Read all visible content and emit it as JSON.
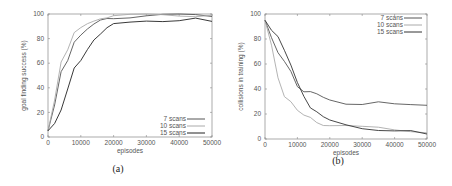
{
  "chart_data": [
    {
      "type": "line",
      "caption": "(a)",
      "title": "",
      "xlabel": "episodes",
      "ylabel": "goal finding success (%)",
      "xlim": [
        0,
        50000
      ],
      "ylim": [
        0,
        100
      ],
      "xticks": [
        "0",
        "10000",
        "20000",
        "30000",
        "40000",
        "50000"
      ],
      "yticks": [
        "0",
        "20",
        "40",
        "60",
        "80",
        "100"
      ],
      "grid": false,
      "legend_position": "lower right",
      "x": [
        0,
        2000,
        4000,
        6000,
        8000,
        10000,
        12000,
        14000,
        16000,
        18000,
        20000,
        25000,
        30000,
        35000,
        40000,
        45000,
        50000
      ],
      "series": [
        {
          "name": "7 scans",
          "color": "#555555",
          "values": [
            5,
            25,
            52,
            62,
            78,
            84,
            88,
            91,
            94,
            96,
            97,
            98,
            99,
            99,
            99,
            99,
            98
          ]
        },
        {
          "name": "10 scans",
          "color": "#aaaaaa",
          "values": [
            5,
            30,
            62,
            72,
            85,
            88,
            91,
            94,
            97,
            98,
            99,
            99,
            99,
            99,
            99,
            99,
            99
          ]
        },
        {
          "name": "15 scans",
          "color": "#222222",
          "values": [
            5,
            12,
            22,
            38,
            55,
            62,
            72,
            80,
            84,
            88,
            91,
            93,
            95,
            95,
            95,
            96,
            94
          ]
        }
      ]
    },
    {
      "type": "line",
      "caption": "(b)",
      "title": "",
      "xlabel": "episodes",
      "ylabel": "collisions in training (%)",
      "xlim": [
        0,
        50000
      ],
      "ylim": [
        0,
        100
      ],
      "xticks": [
        "0",
        "10000",
        "20000",
        "30000",
        "40000",
        "50000"
      ],
      "yticks": [
        "0",
        "20",
        "40",
        "60",
        "80",
        "100"
      ],
      "grid": false,
      "legend_position": "upper right",
      "x": [
        0,
        2000,
        4000,
        6000,
        8000,
        10000,
        12000,
        14000,
        16000,
        18000,
        20000,
        25000,
        30000,
        35000,
        40000,
        45000,
        50000
      ],
      "series": [
        {
          "name": "7 scans",
          "color": "#555555",
          "values": [
            95,
            80,
            68,
            62,
            55,
            43,
            38,
            37,
            35,
            33,
            32,
            29,
            28,
            29,
            27,
            27,
            27
          ]
        },
        {
          "name": "10 scans",
          "color": "#aaaaaa",
          "values": [
            95,
            75,
            50,
            35,
            30,
            22,
            18,
            17,
            14,
            12,
            11,
            10,
            9,
            9,
            8,
            7,
            5
          ]
        },
        {
          "name": "15 scans",
          "color": "#333333",
          "values": [
            95,
            88,
            82,
            70,
            58,
            45,
            35,
            26,
            22,
            17,
            14,
            11,
            9,
            8,
            7,
            6,
            4
          ]
        }
      ]
    }
  ]
}
